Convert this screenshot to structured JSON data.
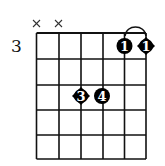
{
  "chord_diagram": {
    "starting_fret_label": "3",
    "strings": 6,
    "frets_shown": 5,
    "muted_strings": [
      {
        "string": 6,
        "symbol": "×"
      },
      {
        "string": 5,
        "symbol": "×"
      }
    ],
    "barre": {
      "finger": "1",
      "from_string": 2,
      "to_string": 1,
      "fret": 1
    },
    "fingerings": [
      {
        "string": 2,
        "fret": 1,
        "finger": "1",
        "shape": "circle"
      },
      {
        "string": 1,
        "fret": 1,
        "finger": "1",
        "shape": "diamond"
      },
      {
        "string": 4,
        "fret": 3,
        "finger": "3",
        "shape": "diamond"
      },
      {
        "string": 3,
        "fret": 3,
        "finger": "4",
        "shape": "circle"
      }
    ],
    "colors": {
      "grid": "#111111",
      "dot": "#000000",
      "dot_text": "#ffffff"
    }
  }
}
